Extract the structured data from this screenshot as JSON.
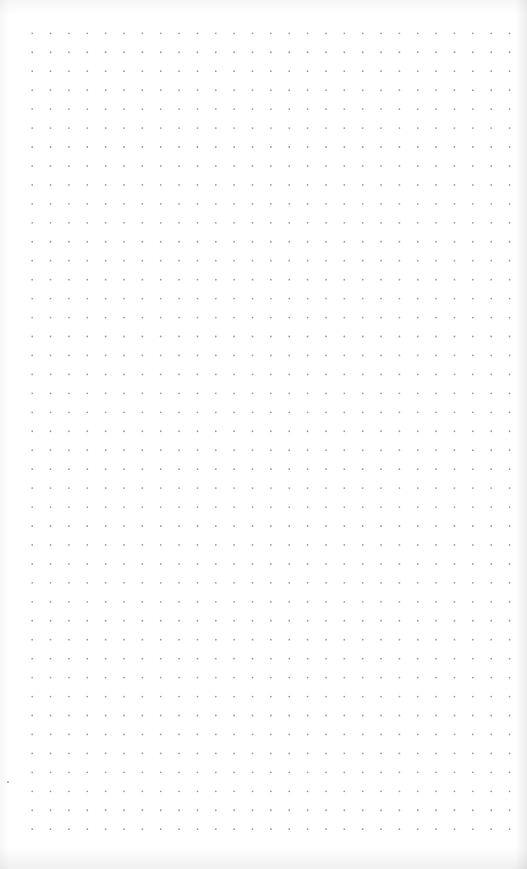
{
  "page": {
    "background_color": "#ffffff",
    "dot_color": "#9a9a9a"
  },
  "dot_grid": {
    "origin_x": 32.2,
    "origin_y": 33.3,
    "spacing_x": 18.36,
    "spacing_y": 18.95,
    "columns": 27,
    "rows": 43,
    "dot_radius": 0.9
  },
  "stray_marks": [
    {
      "x": 8,
      "y": 782,
      "radius": 0.9
    }
  ]
}
